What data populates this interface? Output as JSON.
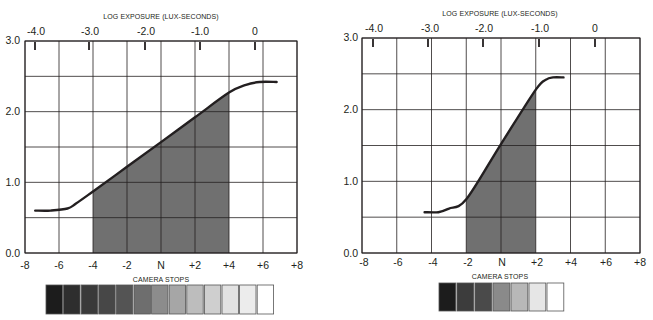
{
  "chart_data": [
    {
      "type": "line",
      "name": "characteristic-curve-low-contrast",
      "title": "",
      "top_axis_title": "LOG EXPOSURE (LUX-SECONDS)",
      "top_axis_ticks": [
        "-4.0",
        "-3.0",
        "-2.0",
        "-1.0",
        "0"
      ],
      "xlabel": "CAMERA STOPS",
      "x_ticks": [
        "-8",
        "-6",
        "-4",
        "-2",
        "N",
        "+2",
        "+4",
        "+6",
        "+8"
      ],
      "x_range": [
        -8,
        8
      ],
      "ylabel": "",
      "y_ticks": [
        "0.0",
        "1.0",
        "2.0",
        "3.0"
      ],
      "ylim": [
        0.0,
        3.0
      ],
      "grid": true,
      "series": [
        {
          "name": "density curve",
          "x": [
            -7.4,
            -6.5,
            -5.5,
            -5.0,
            -4.0,
            -2.0,
            0.0,
            2.0,
            4.0,
            5.0,
            5.8,
            6.8
          ],
          "y": [
            0.6,
            0.6,
            0.63,
            0.7,
            0.87,
            1.22,
            1.57,
            1.92,
            2.27,
            2.38,
            2.42,
            2.42
          ]
        }
      ],
      "shaded_range": {
        "x_from": -4,
        "x_to": 4,
        "color": "#707070"
      },
      "gray_scale_steps": 13,
      "gray_scale_colors": [
        "#1c1c1c",
        "#2e2e2e",
        "#3a3a3a",
        "#474747",
        "#545454",
        "#6e6e6e",
        "#8c8c8c",
        "#a6a6a6",
        "#bdbdbd",
        "#cfcfcf",
        "#e2e2e2",
        "#ececec",
        "#ffffff"
      ]
    },
    {
      "type": "line",
      "name": "characteristic-curve-high-contrast",
      "title": "",
      "top_axis_title": "LOG EXPOSURE (LUX-SECONDS)",
      "top_axis_ticks": [
        "-4.0",
        "-3.0",
        "-2.0",
        "-1.0",
        "0"
      ],
      "xlabel": "CAMERA STOPS",
      "x_ticks": [
        "-8",
        "-6",
        "-4",
        "-2",
        "N",
        "+2",
        "+4",
        "+6",
        "+8"
      ],
      "x_range": [
        -8,
        8
      ],
      "ylabel": "",
      "y_ticks": [
        "0.0",
        "1.0",
        "2.0",
        "3.0"
      ],
      "ylim": [
        0.0,
        3.0
      ],
      "grid": true,
      "series": [
        {
          "name": "density curve",
          "x": [
            -4.4,
            -3.6,
            -3.0,
            -2.0,
            0.0,
            2.0,
            2.6,
            3.0,
            3.6
          ],
          "y": [
            0.57,
            0.57,
            0.62,
            0.75,
            1.52,
            2.28,
            2.42,
            2.45,
            2.45
          ]
        }
      ],
      "shaded_range": {
        "x_from": -2,
        "x_to": 2,
        "color": "#707070"
      },
      "gray_scale_steps": 7,
      "gray_scale_colors": [
        "#1c1c1c",
        "#3c3c3c",
        "#4a4a4a",
        "#8a8a8a",
        "#b8b8b8",
        "#e6e6e6",
        "#ffffff"
      ]
    }
  ],
  "labels": {
    "left": {
      "top_axis_title": "LOG EXPOSURE (LUX-SECONDS)",
      "bottom_axis_title": "CAMERA STOPS",
      "log_ticks": [
        "-4.0",
        "-3.0",
        "-2.0",
        "-1.0",
        "0"
      ],
      "stop_ticks": [
        "-8",
        "-6",
        "-4",
        "-2",
        "N",
        "+2",
        "+4",
        "+6",
        "+8"
      ],
      "density_ticks": [
        "0.0",
        "1.0",
        "2.0",
        "3.0"
      ]
    },
    "right": {
      "top_axis_title": "LOG EXPOSURE (LUX-SECONDS)",
      "bottom_axis_title": "CAMERA STOPS",
      "log_ticks": [
        "-4.0",
        "-3.0",
        "-2.0",
        "-1.0",
        "0"
      ],
      "stop_ticks": [
        "-8",
        "-6",
        "-4",
        "-2",
        "N",
        "+2",
        "+4",
        "+6",
        "+8"
      ],
      "density_ticks": [
        "0.0",
        "1.0",
        "2.0",
        "3.0"
      ]
    }
  }
}
